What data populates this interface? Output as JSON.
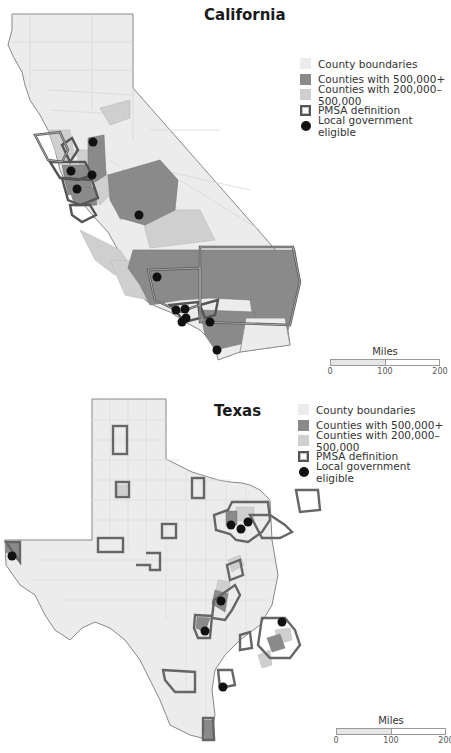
{
  "california": {
    "title": "California",
    "legend": [
      {
        "key": "county",
        "label": "County boundaries",
        "color": "#ececec"
      },
      {
        "key": "500k",
        "label": "Counties with 500,000+",
        "color": "#8a8a8a"
      },
      {
        "key": "200k",
        "label": "Counties with 200,000–500,000",
        "color": "#cfcfcf"
      },
      {
        "key": "pmsa",
        "label": "PMSA definition",
        "color": "#555555"
      },
      {
        "key": "dot",
        "label": "Local government eligible",
        "color": "#111111"
      }
    ],
    "scale": {
      "title": "Miles",
      "ticks": [
        "0",
        "100",
        "200"
      ]
    }
  },
  "texas": {
    "title": "Texas",
    "legend": [
      {
        "key": "county",
        "label": "County boundaries",
        "color": "#ececec"
      },
      {
        "key": "500k",
        "label": "Counties with 500,000+",
        "color": "#8a8a8a"
      },
      {
        "key": "200k",
        "label": "Counties with 200,000–500,000",
        "color": "#cfcfcf"
      },
      {
        "key": "pmsa",
        "label": "PMSA definition",
        "color": "#555555"
      },
      {
        "key": "dot",
        "label": "Local government eligible",
        "color": "#111111"
      }
    ],
    "scale": {
      "title": "Miles",
      "ticks": [
        "0",
        "100",
        "200"
      ]
    }
  }
}
